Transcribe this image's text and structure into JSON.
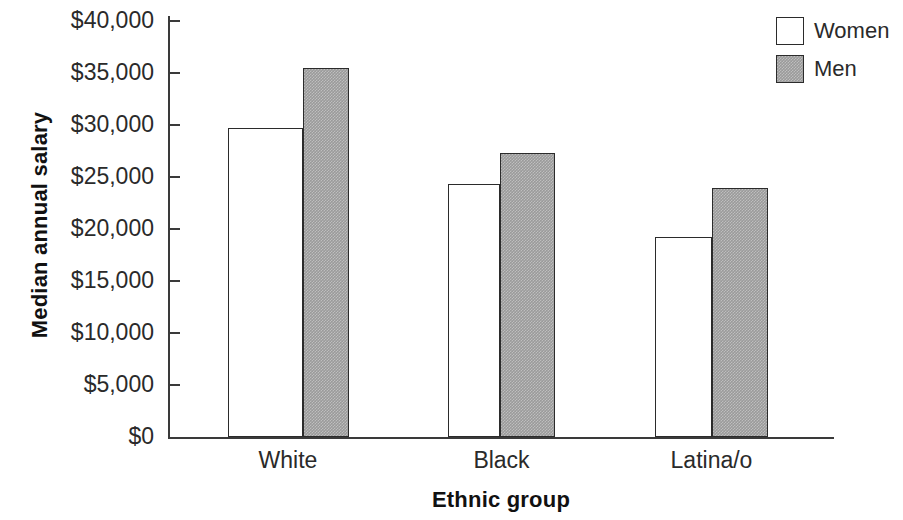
{
  "chart_data": {
    "type": "bar",
    "title": "",
    "xlabel": "Ethnic group",
    "ylabel": "Median annual salary",
    "categories": [
      "White",
      "Black",
      "Latina/o"
    ],
    "series": [
      {
        "name": "Women",
        "values": [
          29600,
          24300,
          19200
        ],
        "fill": "#ffffff",
        "stroke": "#2b2b2b"
      },
      {
        "name": "Men",
        "values": [
          35400,
          27200,
          23900
        ],
        "fill": "#9a9a9a",
        "stroke": "#2b2b2b"
      }
    ],
    "ylim": [
      0,
      40000
    ],
    "ytick_values": [
      0,
      5000,
      10000,
      15000,
      20000,
      25000,
      30000,
      35000,
      40000
    ],
    "ytick_labels": [
      "$0",
      "$5,000",
      "$10,000",
      "$15,000",
      "$20,000",
      "$25,000",
      "$30,000",
      "$35,000",
      "$40,000"
    ],
    "grid": false,
    "legend_position": "top-right",
    "legend_entries": [
      "Women",
      "Men"
    ]
  },
  "axes": {
    "y_title": "Median annual salary",
    "x_title": "Ethnic group",
    "y_labels": [
      "$40,000",
      "$35,000",
      "$30,000",
      "$25,000",
      "$20,000",
      "$15,000",
      "$10,000",
      "$5,000",
      "$0"
    ],
    "x_labels": [
      "White",
      "Black",
      "Latina/o"
    ],
    "axis_color": "#3a3a3a"
  },
  "legend": {
    "items": [
      {
        "label": "Women",
        "swatch": "white-square-swatch"
      },
      {
        "label": "Men",
        "swatch": "gray-square-swatch"
      }
    ]
  }
}
